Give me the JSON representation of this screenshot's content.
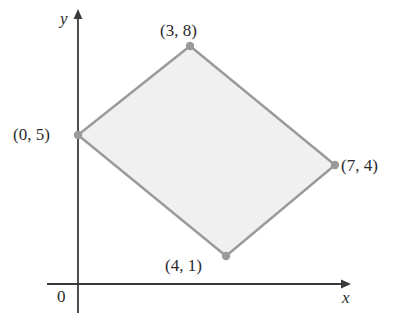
{
  "figure": {
    "type": "coordinate-plane-quadrilateral",
    "background_color": "#ffffff"
  },
  "axes": {
    "x_label": "x",
    "y_label": "y",
    "origin_label": "0",
    "color": "#3a3a3a",
    "x_axis_label_name": "x-axis-label",
    "y_axis_label_name": "y-axis-label"
  },
  "shape": {
    "name": "quadrilateral",
    "fill_color": "#f0f0f0",
    "stroke_color": "#9a9a9a",
    "vertex_dot_color": "#9a9a9a"
  },
  "chart_data": {
    "type": "scatter",
    "title": "",
    "xlabel": "x",
    "ylabel": "y",
    "grid": false,
    "legend": null,
    "xlim": [
      0,
      8
    ],
    "ylim": [
      0,
      9
    ],
    "annotations": [
      "0"
    ],
    "vertices": [
      {
        "label": "(0, 5)",
        "x": 0,
        "y": 5,
        "px": 78,
        "py": 135,
        "label_side": "left"
      },
      {
        "label": "(3, 8)",
        "x": 3,
        "y": 8,
        "px": 190,
        "py": 46,
        "label_side": "top"
      },
      {
        "label": "(7, 4)",
        "x": 7,
        "y": 4,
        "px": 335,
        "py": 165,
        "label_side": "right"
      },
      {
        "label": "(4, 1)",
        "x": 4,
        "y": 1,
        "px": 226,
        "py": 256,
        "label_side": "bottom-left"
      }
    ],
    "labels": {
      "v1": "(0, 5)",
      "v2": "(3, 8)",
      "v3": "(7, 4)",
      "v4": "(4, 1)"
    }
  }
}
